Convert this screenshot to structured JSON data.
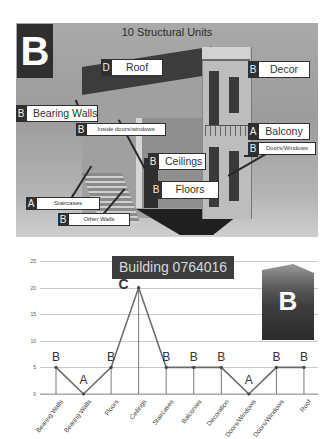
{
  "panel": {
    "title": "10 Structural Units",
    "badge": "B",
    "callouts": [
      {
        "grade": "D",
        "label": "Roof"
      },
      {
        "grade": "B",
        "label": "Decor"
      },
      {
        "grade": "B",
        "label": "Bearing Walls"
      },
      {
        "grade": "B",
        "label": "Inside doors/windows"
      },
      {
        "grade": "A",
        "label": "Balcony"
      },
      {
        "grade": "B",
        "label": "Doors/Windows"
      },
      {
        "grade": "B",
        "label": "Ceilings"
      },
      {
        "grade": "B",
        "label": "Floors"
      },
      {
        "grade": "A",
        "label": "Staircases"
      },
      {
        "grade": "B",
        "label": "Other Walls"
      }
    ]
  },
  "chart_data": {
    "type": "line",
    "title": "Building 0764016",
    "photo_badge": "B",
    "categories": [
      "Bearing Walls",
      "Bearing Walls",
      "Floors",
      "Ceilings",
      "Staircases",
      "Balconies",
      "Decoration",
      "Doors/Windows",
      "Doors/Windows",
      "Roof"
    ],
    "values": [
      5,
      0,
      5,
      20,
      5,
      5,
      5,
      0,
      5,
      5
    ],
    "point_labels": [
      "B",
      "A",
      "B",
      "C",
      "B",
      "B",
      "B",
      "A",
      "B",
      "B"
    ],
    "yticks": [
      "25",
      "20",
      "15",
      "10",
      "5",
      "0"
    ],
    "ylim": [
      0,
      25
    ],
    "xlabel": "",
    "ylabel": "",
    "grid": true,
    "drop_lines": true
  }
}
